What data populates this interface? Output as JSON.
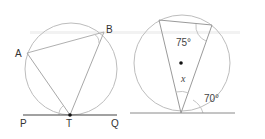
{
  "figure_left": {
    "points": {
      "A": {
        "label": "A"
      },
      "B": {
        "label": "B"
      },
      "T": {
        "label": "T"
      },
      "P": {
        "label": "P"
      },
      "Q": {
        "label": "Q"
      }
    },
    "description": "Circle with inscribed triangle ATB, tangent line PQ at T"
  },
  "figure_right": {
    "angle_top": "75°",
    "angle_unknown": "x",
    "angle_tangent": "70°",
    "description": "Circle with center marked, inscribed triangle, tangent line at bottom vertex"
  },
  "colors": {
    "circle_stroke": "#b8b8b8",
    "line_stroke": "#a8a8a8",
    "tangent_stroke": "#555555",
    "point_fill": "#111111"
  }
}
